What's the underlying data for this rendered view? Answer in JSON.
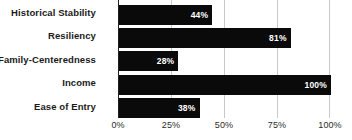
{
  "chart_data": {
    "type": "bar",
    "orientation": "horizontal",
    "title": "",
    "xlabel": "",
    "ylabel": "",
    "categories": [
      "Historical Stability",
      "Resiliency",
      "Family-Centeredness",
      "Income",
      "Ease of Entry"
    ],
    "values": [
      44,
      81,
      28,
      100,
      38
    ],
    "value_labels": [
      "44%",
      "81%",
      "28%",
      "100%",
      "38%"
    ],
    "xlim": [
      0,
      100
    ],
    "ticks": [
      0,
      25,
      50,
      75,
      100
    ],
    "tick_labels": [
      "0%",
      "25%",
      "50%",
      "75%",
      "100%"
    ],
    "grid": true,
    "legend": false,
    "bar_color": "#0a0a0a",
    "value_label_color": "#ffffff",
    "gridline_color": "#c9c9c9",
    "axis_color": "#222222",
    "background": "#ffffff"
  }
}
